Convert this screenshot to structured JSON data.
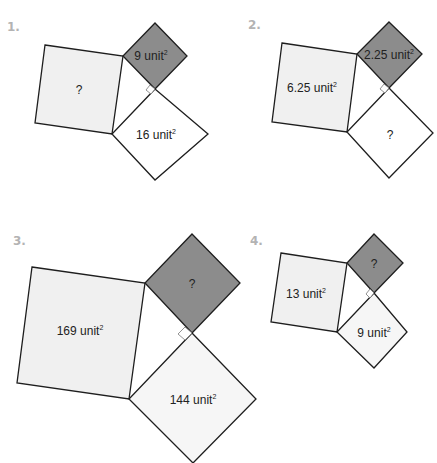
{
  "colors": {
    "light_square": "#f0f0f0",
    "dark_square": "#8c8c8c",
    "white_square": "#ffffff",
    "stroke": "#1e1e1e",
    "number_label": "#b3b3b3"
  },
  "unit_suffix": "unit",
  "exponent": "2",
  "problems": [
    {
      "number": "1.",
      "large_square": {
        "label": "?",
        "fill": "light"
      },
      "dark_square": {
        "label": "9 unit",
        "value": "9",
        "fill": "dark"
      },
      "white_square": {
        "label": "16 unit",
        "value": "16",
        "fill": "white"
      }
    },
    {
      "number": "2.",
      "large_square": {
        "label": "6.25 unit",
        "value": "6.25",
        "fill": "light"
      },
      "dark_square": {
        "label": "2.25 unit",
        "value": "2.25",
        "fill": "dark"
      },
      "white_square": {
        "label": "?",
        "fill": "white"
      }
    },
    {
      "number": "3.",
      "large_square": {
        "label": "169 unit",
        "value": "169",
        "fill": "light"
      },
      "dark_square": {
        "label": "?",
        "fill": "dark"
      },
      "white_square": {
        "label": "144 unit",
        "value": "144",
        "fill": "light"
      }
    },
    {
      "number": "4.",
      "large_square": {
        "label": "13 unit",
        "value": "13",
        "fill": "light"
      },
      "dark_square": {
        "label": "?",
        "fill": "dark"
      },
      "white_square": {
        "label": "9 unit",
        "value": "9",
        "fill": "light"
      }
    }
  ]
}
